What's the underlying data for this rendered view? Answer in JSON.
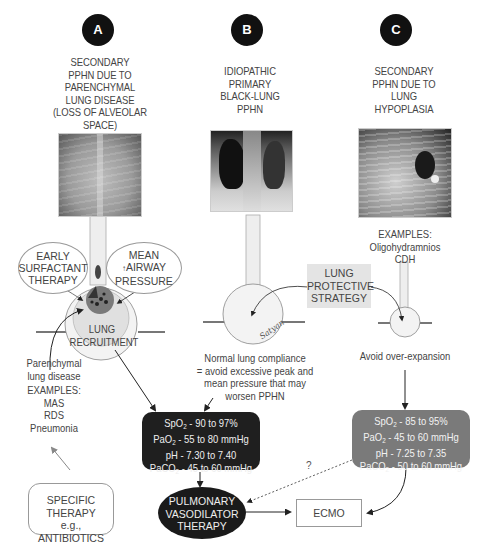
{
  "columns": [
    {
      "badge": "A",
      "title_lines": [
        "SECONDARY",
        "PPHN DUE TO",
        "PARENCHYMAL",
        "LUNG DISEASE",
        "(LOSS OF ALVEOLAR",
        "SPACE)"
      ],
      "xray_label": "Chest X-ray: diffuse parenchymal lung disease"
    },
    {
      "badge": "B",
      "title_lines": [
        "IDIOPATHIC",
        "PRIMARY",
        "BLACK-LUNG",
        "PPHN"
      ],
      "xray_label": "Chest X-ray: black-lung PPHN"
    },
    {
      "badge": "C",
      "title_lines": [
        "SECONDARY",
        "PPHN DUE TO",
        "LUNG",
        "HYPOPLASIA"
      ],
      "xray_label": "Chest X-ray: lung hypoplasia"
    }
  ],
  "column_a": {
    "oval_left": [
      "EARLY",
      "SURFACTANT",
      "THERAPY"
    ],
    "oval_right": [
      "MEAN",
      "AIRWAY",
      "PRESSURE"
    ],
    "recruitment_label": [
      "LUNG",
      "RECRUITMENT"
    ],
    "disease_note": [
      "Parenchymal",
      "lung disease"
    ],
    "examples_title": "EXAMPLES:",
    "examples": [
      "MAS",
      "RDS",
      "Pneumonia"
    ],
    "specific_therapy": [
      "SPECIFIC",
      "THERAPY",
      "e.g., ANTIBIOTICS"
    ]
  },
  "column_b": {
    "signature": "Satyan",
    "note": [
      "Normal lung compliance",
      "= avoid excessive peak and",
      "mean pressure that may",
      "worsen PPHN"
    ]
  },
  "column_c": {
    "examples_title": "EXAMPLES:",
    "examples": [
      "Oligohydramnios",
      "CDH"
    ],
    "note": "Avoid over-expansion"
  },
  "lung_protective_strategy": [
    "LUNG",
    "PROTECTIVE",
    "STRATEGY"
  ],
  "targets_ab": {
    "spo2": "90 to 97%",
    "pao2": "55 to 80 mmHg",
    "ph": "7.30 to 7.40",
    "paco2": "45 to 60 mmHg"
  },
  "targets_c": {
    "spo2": "85 to 95%",
    "pao2": "45 to 60 mmHg",
    "ph": "7.25 to 7.35",
    "paco2": "50 to 60 mmHg"
  },
  "labels": {
    "spo2": "SpO",
    "pao2": "PaO",
    "ph": "pH",
    "paco2": "PaCO",
    "sub2": "2",
    "sep": " - "
  },
  "pulmonary_vasodilator_therapy": [
    "PULMONARY",
    "VASODILATOR",
    "THERAPY"
  ],
  "ecmo": "ECMO",
  "question_mark": "?",
  "colors": {
    "dark_box": "#1f1f1f",
    "gray_box": "#7a7a7a",
    "lps_box": "#e4e4e4",
    "badge": "#111111"
  }
}
